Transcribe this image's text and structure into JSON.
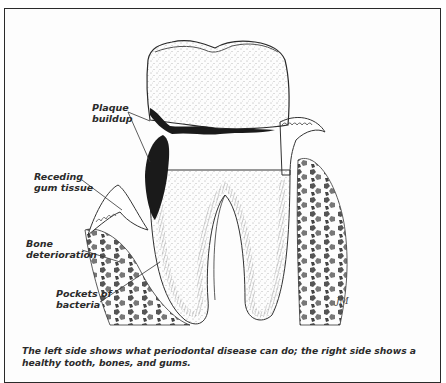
{
  "figure": {
    "labels": [
      {
        "id": "plaque",
        "text": "Plaque\nbuildup"
      },
      {
        "id": "gum",
        "text": "Receding\ngum tissue"
      },
      {
        "id": "bone",
        "text": "Bone\ndeterioration"
      },
      {
        "id": "pockets",
        "text": "Pockets of\nbacteria"
      }
    ],
    "artist_signature": "JM",
    "caption": "The left side shows what periodontal disease can do; the right side shows a healthy tooth, bones, and gums."
  },
  "colors": {
    "ink": "#2b2b2b",
    "plaque": "#1a1a1a",
    "bone_chip": "#6a6a6a",
    "background": "#ffffff"
  }
}
